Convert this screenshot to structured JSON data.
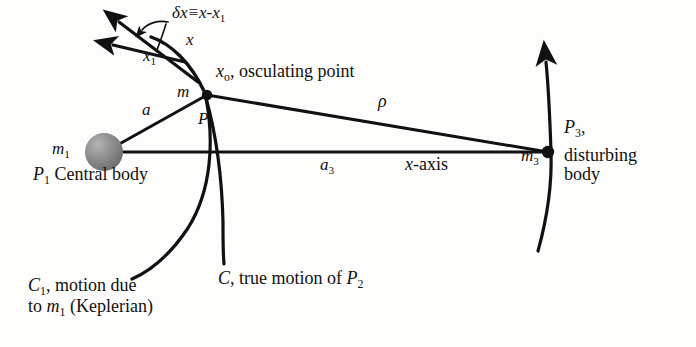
{
  "figure": {
    "width": 696,
    "height": 347,
    "background_color": "#fdfdfb",
    "stroke_color": "#111111",
    "body_fill_color": "#8a8a8a"
  },
  "labels": {
    "delta_x": {
      "lead": "δx≡x-x",
      "sub": "1",
      "meaning": "delta x defined as x minus x sub 1"
    },
    "x": {
      "text": "x"
    },
    "x1": {
      "text": "x",
      "sub": "1"
    },
    "x_osculating": {
      "symbol": "x",
      "sub": "o",
      "text": ", osculating point"
    },
    "m": {
      "text": "m"
    },
    "a": {
      "text": "a"
    },
    "p2": {
      "text": "P",
      "sub": "2"
    },
    "rho": {
      "text": "ρ"
    },
    "m1": {
      "text": "m",
      "sub": "1"
    },
    "p1_central": {
      "text": "P",
      "sub": "1",
      "tail": " Central body"
    },
    "a3": {
      "text": "a",
      "sub": "3"
    },
    "x_axis": {
      "symbol": "x",
      "text": "-axis"
    },
    "m3": {
      "text": "m",
      "sub": "3"
    },
    "p3": {
      "text": "P",
      "sub": "3",
      "tail": ","
    },
    "disturbing_body_line1": "disturbing",
    "disturbing_body_line2": "body",
    "c1_caption": {
      "symbol": "C",
      "sub": "1",
      "line1_tail": ", motion due",
      "line2_pre": "to ",
      "line2_symbol": "m",
      "line2_sub": "1",
      "line2_tail": " (Keplerian)"
    },
    "c_caption": {
      "symbol": "C",
      "tail": ", true motion of ",
      "p_symbol": "P",
      "p_sub": "2"
    }
  },
  "geometry": {
    "central_body": {
      "cx": 104,
      "cy": 152,
      "r": 19
    },
    "osculating_point": {
      "cx": 207,
      "cy": 95,
      "r": 5
    },
    "disturbing_point": {
      "cx": 548,
      "cy": 152,
      "r": 6
    },
    "x_axis_line": {
      "x1": 104,
      "y1": 152,
      "x2": 548,
      "y2": 152
    },
    "a_line": {
      "x1": 104,
      "y1": 152,
      "x2": 207,
      "y2": 95
    },
    "rho_line": {
      "x1": 207,
      "y1": 95,
      "x2": 548,
      "y2": 152
    },
    "vector_x_tip": {
      "x": 114,
      "y": 18
    },
    "vector_x1_tip": {
      "x": 108,
      "y": 45
    }
  }
}
